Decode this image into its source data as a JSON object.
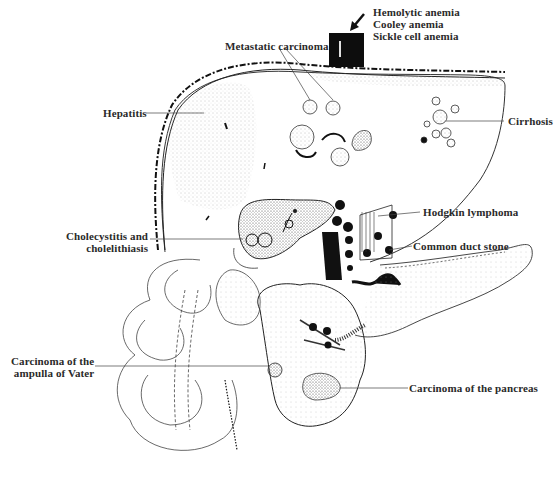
{
  "diagram": {
    "colors": {
      "ink": "#1a1a1a",
      "label": "#2a2a2a",
      "background": "#ffffff",
      "stipple": "#9a9a9a"
    },
    "labels": {
      "hemolytic": "Hemolytic anemia\nCooley anemia\nSickle cell anemia",
      "metastatic": "Metastatic carcinoma",
      "hepatitis": "Hepatitis",
      "cirrhosis": "Cirrhosis",
      "cholecystitis": "Cholecystitis and\ncholelithiasis",
      "hodgkin": "Hodgkin lymphoma",
      "common_duct": "Common duct stone",
      "ampulla": "Carcinoma of the\nampulla of Vater",
      "pancreas": "Carcinoma of the pancreas"
    },
    "icons": {
      "arrow": "arrow-down-left-icon",
      "block": "black-block-icon"
    }
  }
}
